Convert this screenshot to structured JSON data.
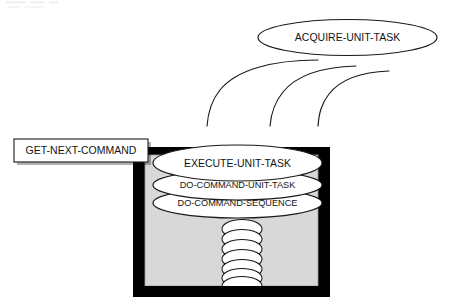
{
  "diagram": {
    "background_color": "#ffffff",
    "nodes": {
      "acquire": {
        "label": "ACQUIRE-UNIT-TASK",
        "shape": "ellipse",
        "fill": "#ffffff",
        "stroke": "#1a1a1a"
      },
      "get_next_command": {
        "label": "GET-NEXT-COMMAND",
        "shape": "rectangle",
        "fill": "#ffffff",
        "stroke": "#1a1a1a"
      },
      "execute": {
        "label": "EXECUTE-UNIT-TASK",
        "shape": "ellipse",
        "fill": "#ffffff",
        "stroke": "#1a1a1a"
      },
      "do_command_unit_task": {
        "label": "DO-COMMAND-UNIT-TASK",
        "shape": "ellipse",
        "fill": "#ffffff",
        "stroke": "#1a1a1a"
      },
      "do_command_sequence": {
        "label": "DO-COMMAND-SEQUENCE",
        "shape": "ellipse",
        "fill": "#ffffff",
        "stroke": "#1a1a1a"
      }
    },
    "container": {
      "name": "execution-frame",
      "border_color": "#000000",
      "fill_color": "#d8d8d8"
    },
    "chain": {
      "name": "command-chain",
      "segment_count": 7,
      "fill": "#ffffff",
      "stroke": "#1a1a1a"
    },
    "arcs": {
      "name": "acquire-arcs",
      "count": 3,
      "stroke": "#1a1a1a"
    }
  }
}
